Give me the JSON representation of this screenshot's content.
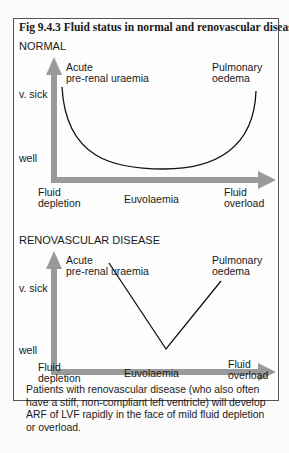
{
  "figure": {
    "title": "Fig 9.4.3 Fluid status in normal and renovascular disease",
    "arrow_color": "#999999",
    "line_color": "#111111"
  },
  "panels": [
    {
      "heading": "NORMAL",
      "curve": "U-shaped",
      "y_axis": {
        "top": "v. sick",
        "bottom": "well"
      },
      "x_axis": {
        "left": [
          "Fluid",
          "depletion"
        ],
        "center": "Euvolaemia",
        "right": [
          "Fluid",
          "overload"
        ]
      },
      "top_left_label": [
        "Acute",
        "pre-renal uraemia"
      ],
      "top_right_label": [
        "Pulmonary",
        "oedema"
      ]
    },
    {
      "heading": "RENOVASCULAR DISEASE",
      "curve": "V-shaped",
      "y_axis": {
        "top": "v. sick",
        "bottom": "well"
      },
      "x_axis": {
        "left": [
          "Fluid",
          "depletion"
        ],
        "center": "Euvolaemia",
        "right": [
          "Fluid",
          "overload"
        ]
      },
      "top_left_label": [
        "Acute",
        "pre-renal uraemia"
      ],
      "top_right_label": [
        "Pulmonary",
        "oedema"
      ]
    }
  ],
  "caption": "Patients with renovascular disease (who also often have a stiff, non-compliant left ventricle) will develop ARF of LVF rapidly in the face of mild fluid depletion or overload."
}
